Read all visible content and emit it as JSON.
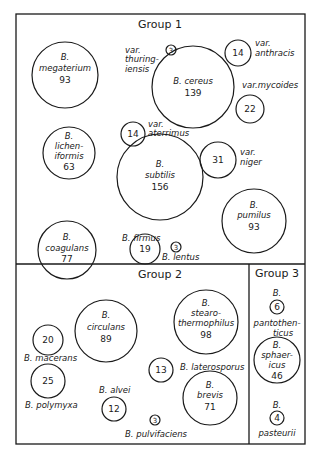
{
  "diagram": {
    "type": "bubble-group-diagram",
    "groups": [
      {
        "label": "Group 1",
        "species": [
          {
            "name": "B. megaterium",
            "lines": [
              "B.",
              "megaterium"
            ],
            "value": "93"
          },
          {
            "name": "B. cereus",
            "lines": [
              "B. cereus"
            ],
            "value": "139"
          },
          {
            "name": "var. thuringiensis",
            "lines": [
              "var.",
              "thuring-",
              "iensis"
            ],
            "value": "3"
          },
          {
            "name": "var. anthracis",
            "lines": [
              "var.",
              "anthracis"
            ],
            "value": "14"
          },
          {
            "name": "var. mycoides",
            "lines": [
              "var.mycoides"
            ],
            "value": "22"
          },
          {
            "name": "B. licheniformis",
            "lines": [
              "B.",
              "lichen-",
              "iformis"
            ],
            "value": "63"
          },
          {
            "name": "var. aterrimus",
            "lines": [
              "var.",
              "aterrimus"
            ],
            "value": "14"
          },
          {
            "name": "B. subtilis",
            "lines": [
              "B.",
              "subtilis"
            ],
            "value": "156"
          },
          {
            "name": "var. niger",
            "lines": [
              "var.",
              "niger"
            ],
            "value": "31"
          },
          {
            "name": "B. pumilus",
            "lines": [
              "B.",
              "pumilus"
            ],
            "value": "93"
          },
          {
            "name": "B. coagulans",
            "lines": [
              "B.",
              "coagulans"
            ],
            "value": "77"
          },
          {
            "name": "B. firmus",
            "lines": [
              "B. firmus"
            ],
            "value": "19"
          },
          {
            "name": "B. lentus",
            "lines": [
              "B. lentus"
            ],
            "value": "3"
          }
        ]
      },
      {
        "label": "Group 2",
        "species": [
          {
            "name": "B. circulans",
            "lines": [
              "B.",
              "circulans"
            ],
            "value": "89"
          },
          {
            "name": "B. stearothermophilus",
            "lines": [
              "B.",
              "stearo-",
              "thermophilus"
            ],
            "value": "98"
          },
          {
            "name": "B. macerans",
            "lines": [
              "B. macerans"
            ],
            "value": "20"
          },
          {
            "name": "B. polymyxa",
            "lines": [
              "B. polymyxa"
            ],
            "value": "25"
          },
          {
            "name": "B. laterosporus",
            "lines": [
              "B. laterosporus"
            ],
            "value": "13"
          },
          {
            "name": "B. alvei",
            "lines": [
              "B. alvei"
            ],
            "value": "12"
          },
          {
            "name": "B. brevis",
            "lines": [
              "B.",
              "brevis"
            ],
            "value": "71"
          },
          {
            "name": "B. pulvifaciens",
            "lines": [
              "B. pulvifaciens"
            ],
            "value": "3"
          }
        ]
      },
      {
        "label": "Group 3",
        "species": [
          {
            "name": "B. pantothenticus",
            "lines": [
              "B.",
              "pantothen-",
              "ticus"
            ],
            "value": "6"
          },
          {
            "name": "B. sphaericus",
            "lines": [
              "B.",
              "sphaer-",
              "icus"
            ],
            "value": "46"
          },
          {
            "name": "B. pasteurii",
            "lines": [
              "B.",
              "pasteurii"
            ],
            "value": "4"
          }
        ]
      }
    ]
  }
}
